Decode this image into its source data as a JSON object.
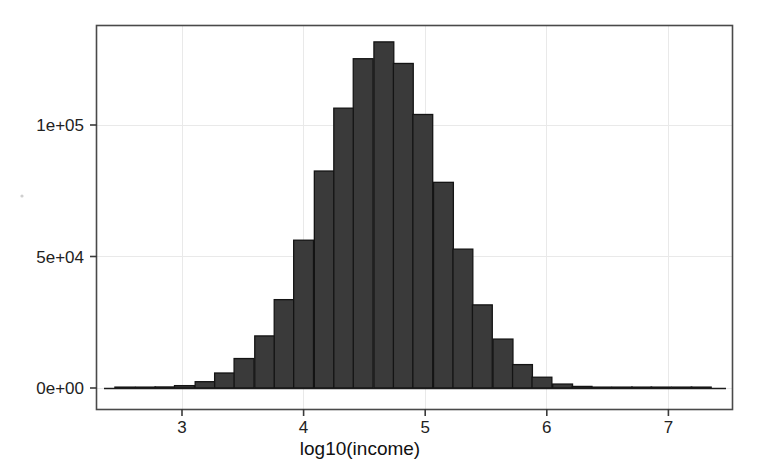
{
  "chart_data": {
    "type": "bar",
    "title": "",
    "subtitle": "",
    "xlabel": "log10(income)",
    "ylabel": "",
    "xlim": [
      2.45,
      7.3
    ],
    "ylim": [
      0,
      136000
    ],
    "grid": true,
    "legend": null,
    "bin_width": 0.1633,
    "x_ticks": [
      3,
      4,
      5,
      6,
      7
    ],
    "x_tick_labels": [
      "3",
      "4",
      "5",
      "6",
      "7"
    ],
    "y_ticks": [
      0,
      50000,
      100000
    ],
    "y_tick_labels": [
      "0e+00",
      "5e+04",
      "1e+05"
    ],
    "bin_centers": [
      2.53,
      2.7,
      2.86,
      3.02,
      3.19,
      3.35,
      3.51,
      3.68,
      3.84,
      4.0,
      4.17,
      4.33,
      4.49,
      4.66,
      4.82,
      4.98,
      5.15,
      5.31,
      5.47,
      5.64,
      5.8,
      5.96,
      6.13,
      6.29,
      6.45,
      6.62,
      6.78,
      6.94,
      7.11,
      7.27
    ],
    "values": [
      200,
      250,
      400,
      900,
      2400,
      5700,
      11200,
      19800,
      33600,
      56200,
      82500,
      106400,
      125200,
      131600,
      123400,
      104000,
      78200,
      52800,
      31600,
      18600,
      8900,
      4100,
      1500,
      600,
      300,
      200,
      150,
      120,
      100,
      80
    ],
    "bar_fill": "#3a3a3a",
    "bar_stroke": "#141414",
    "grid_color": "#e9e9e9",
    "frame_color": "#4a4a4a",
    "peak_value": 131600,
    "peak_bin_center": 4.66
  },
  "axes": {
    "x_axis_label": "log10(income)",
    "y_axis_label": ""
  }
}
